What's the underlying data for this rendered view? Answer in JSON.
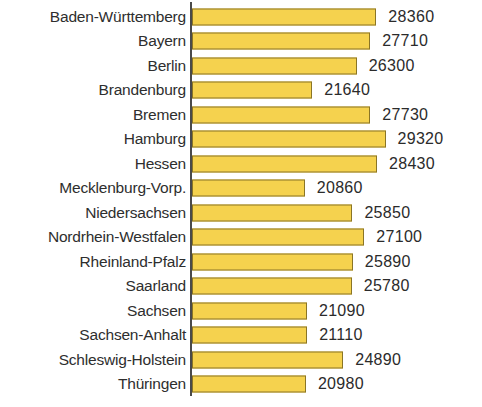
{
  "chart_data": {
    "type": "bar",
    "orientation": "horizontal",
    "title": "",
    "subtitle": "",
    "xlabel": "",
    "ylabel": "",
    "grid": false,
    "legend": null,
    "axis_line": "vertical category axis at left of bars",
    "value_label_position": "outside-end",
    "bar_color": "#F5D24E",
    "bar_border_color": "#8A7526",
    "text_color": "#2B2B2B",
    "background_color": "#FFFFFF",
    "xlim": [
      19000,
      30000
    ],
    "categories": [
      "Baden-Württemberg",
      "Bayern",
      "Berlin",
      "Brandenburg",
      "Bremen",
      "Hamburg",
      "Hessen",
      "Mecklenburg-Vorp.",
      "Niedersachsen",
      "Nordrhein-Westfalen",
      "Rheinland-Pfalz",
      "Saarland",
      "Sachsen",
      "Sachsen-Anhalt",
      "Schleswig-Holstein",
      "Thüringen"
    ],
    "values": [
      28360,
      27710,
      26300,
      21640,
      27730,
      29320,
      28430,
      20860,
      25850,
      27100,
      25890,
      25780,
      21090,
      21110,
      24890,
      20980
    ],
    "value_labels": [
      "28360",
      "27710",
      "26300",
      "21640",
      "27730",
      "29320",
      "28430",
      "20860",
      "25850",
      "27100",
      "25890",
      "25780",
      "21090",
      "21110",
      "24890",
      "20980"
    ]
  }
}
